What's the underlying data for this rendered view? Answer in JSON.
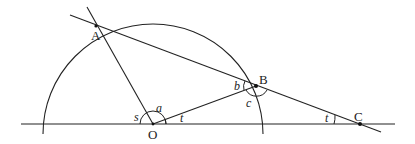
{
  "diagram": {
    "points": {
      "A": {
        "label": "A",
        "x": 96,
        "y": 26
      },
      "B": {
        "label": "B",
        "x": 256,
        "y": 86
      },
      "C": {
        "label": "C",
        "x": 360,
        "y": 124
      },
      "O": {
        "label": "O",
        "x": 153,
        "y": 124
      }
    },
    "angle_labels": {
      "s": "s",
      "a": "a",
      "t_at_O": "t",
      "b": "b",
      "c": "c",
      "t_at_C": "t"
    },
    "colors": {
      "stroke": "#222222",
      "background": "#ffffff"
    }
  }
}
